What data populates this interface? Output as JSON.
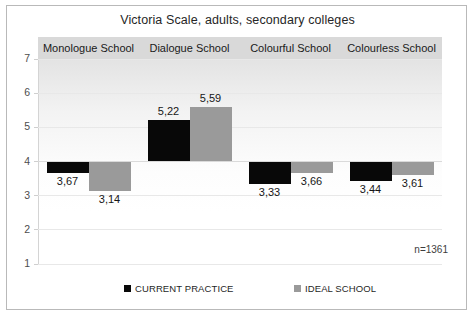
{
  "chart_data": {
    "type": "bar",
    "title": "Victoria Scale, adults, secondary colleges",
    "xlabel": "",
    "ylabel": "",
    "ylim": [
      1,
      7
    ],
    "yticks": [
      1,
      2,
      3,
      4,
      5,
      6,
      7
    ],
    "baseline": 4,
    "grid": true,
    "legend_position": "bottom",
    "annotation": "n=1361",
    "categories": [
      "Monologue School",
      "Dialogue School",
      "Colourful School",
      "Colourless School"
    ],
    "series": [
      {
        "name": "CURRENT PRACTICE",
        "color": "#080808",
        "values": [
          3.67,
          5.22,
          3.33,
          3.44
        ],
        "labels": [
          "3,67",
          "5,22",
          "3,33",
          "3,44"
        ]
      },
      {
        "name": "IDEAL SCHOOL",
        "color": "#9a9a9a",
        "values": [
          3.14,
          5.59,
          3.66,
          3.61
        ],
        "labels": [
          "3,14",
          "5,59",
          "3,66",
          "3,61"
        ]
      }
    ],
    "tick_labels": [
      "7",
      "6",
      "5",
      "4",
      "3",
      "2",
      "1"
    ]
  },
  "legend": {
    "current_label": "CURRENT PRACTICE",
    "ideal_label": "IDEAL SCHOOL"
  }
}
